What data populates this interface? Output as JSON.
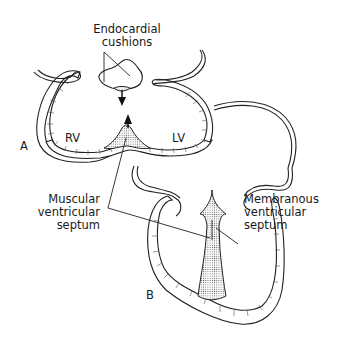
{
  "figure": {
    "panels": [
      {
        "id": "A",
        "label": "A",
        "description": "Cross-section of ventricles with endocardial cushions and muscular septum growing upward"
      },
      {
        "id": "B",
        "label": "B",
        "description": "Four-chamber view of heart with completed muscular and membranous ventricular septum"
      }
    ],
    "labels": {
      "endocardial_cushions_line1": "Endocardial",
      "endocardial_cushions_line2": "cushions",
      "rv": "RV",
      "lv": "LV",
      "panel_a": "A",
      "panel_b": "B",
      "muscular_line1": "Muscular",
      "muscular_line2": "ventricular",
      "muscular_line3": "septum",
      "membranous_line1": "Membranous",
      "membranous_line2": "ventricular",
      "membranous_line3": "septum"
    },
    "colors": {
      "line": "#222222",
      "background": "#ffffff",
      "stipple": "#555555"
    }
  }
}
